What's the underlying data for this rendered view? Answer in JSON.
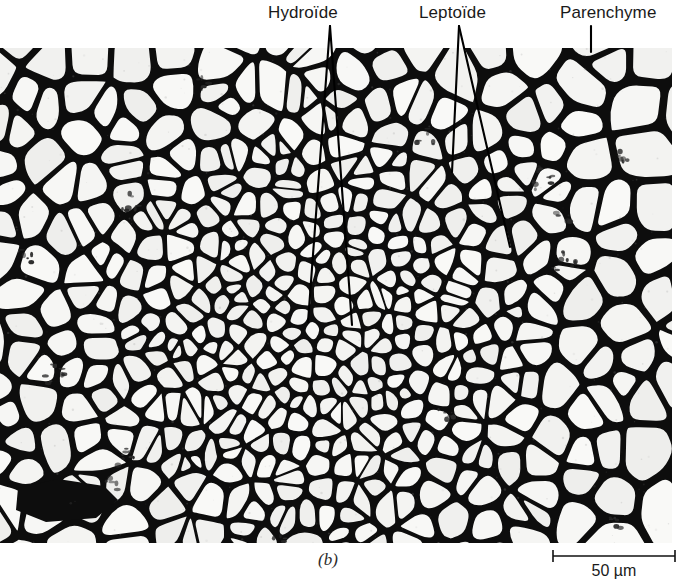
{
  "figure": {
    "panel_letter": "(b)",
    "type": "light micrograph"
  },
  "annotations": [
    {
      "id": "hydroide",
      "label": "Hydroïde",
      "label_x": 268,
      "label_y": 3,
      "leader_apex": [
        330,
        26
      ],
      "leader_tips": [
        [
          308,
          322
        ],
        [
          352,
          325
        ]
      ]
    },
    {
      "id": "leptoide",
      "label": "Leptoïde",
      "label_x": 419,
      "label_y": 3,
      "leader_apex": [
        459,
        26
      ],
      "leader_tips": [
        [
          452,
          172
        ],
        [
          510,
          247
        ]
      ]
    },
    {
      "id": "parenchyme",
      "label": "Parenchyme",
      "label_x": 560,
      "label_y": 3,
      "leader_apex": [
        591,
        26
      ],
      "leader_tips": [
        [
          591,
          52
        ]
      ]
    }
  ],
  "scale_bar": {
    "caption": "50 µm",
    "length_px": 122,
    "value": 50,
    "unit": "µm",
    "x_start": 553,
    "x_end": 675,
    "y": 556
  },
  "micrograph": {
    "x": 0,
    "y": 48,
    "width": 672,
    "height": 495,
    "center": [
      312,
      330
    ],
    "wall_color": "#0d0d0d",
    "lumen_color": "#f2f1ef",
    "paper_color": "#ffffff",
    "seed": 20240517,
    "zones": [
      {
        "name": "hydroid-core",
        "radius": 70,
        "cell_size": 18,
        "wall": 5.0
      },
      {
        "name": "leptoid-ring",
        "radius": 150,
        "cell_size": 22,
        "wall": 6.5
      },
      {
        "name": "inner-cortex",
        "radius": 235,
        "cell_size": 34,
        "wall": 8.0
      },
      {
        "name": "parenchyma-cortex",
        "radius": 400,
        "cell_size": 62,
        "wall": 10.0
      }
    ],
    "debris_specks": [
      [
        132,
        150
      ],
      [
        139,
        157
      ],
      [
        126,
        163
      ],
      [
        52,
        318
      ],
      [
        60,
        325
      ],
      [
        47,
        331
      ],
      [
        126,
        400
      ],
      [
        133,
        408
      ],
      [
        120,
        414
      ],
      [
        108,
        430
      ],
      [
        118,
        437
      ],
      [
        427,
        85
      ],
      [
        436,
        92
      ],
      [
        420,
        97
      ],
      [
        540,
        122
      ],
      [
        551,
        131
      ],
      [
        534,
        137
      ],
      [
        556,
        168
      ],
      [
        566,
        176
      ],
      [
        617,
        107
      ],
      [
        627,
        115
      ],
      [
        560,
        208
      ],
      [
        571,
        216
      ],
      [
        553,
        222
      ],
      [
        276,
        487
      ],
      [
        286,
        493
      ],
      [
        368,
        500
      ],
      [
        377,
        507
      ],
      [
        611,
        468
      ],
      [
        620,
        476
      ],
      [
        198,
        30
      ],
      [
        205,
        37
      ],
      [
        441,
        363
      ],
      [
        449,
        370
      ],
      [
        22,
        203
      ],
      [
        31,
        210
      ]
    ],
    "dark_wedge": {
      "points": "18,440 58,431 104,438 118,452 96,470 46,474 16,462",
      "note": "thick dark wedge on left margin"
    }
  },
  "chart_data": {
    "type": "image",
    "annotations": [
      "Hydroïde",
      "Leptoïde",
      "Parenchyme"
    ],
    "scale": "50 µm"
  }
}
